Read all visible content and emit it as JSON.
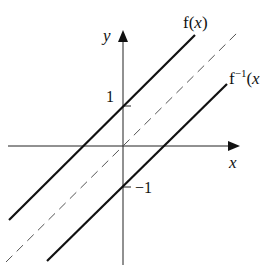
{
  "diagram": {
    "type": "graph-of-function-and-inverse",
    "axes": {
      "x_label": "x",
      "y_label": "y"
    },
    "ticks": {
      "y_pos": "1",
      "y_neg": "−1"
    },
    "curves": [
      {
        "name": "f",
        "label_main": "f(",
        "label_var": "x",
        "label_close": ")",
        "equation": "y = x + 1",
        "style": "solid"
      },
      {
        "name": "f_inverse",
        "label_main": "f",
        "label_sup": "−1",
        "label_paren": "(",
        "label_var": "x",
        "equation": "y = x − 1",
        "style": "solid"
      },
      {
        "name": "identity",
        "equation": "y = x",
        "style": "dashed"
      }
    ],
    "colors": {
      "ink": "#111111",
      "dashed": "#555555",
      "background": "#ffffff"
    }
  }
}
